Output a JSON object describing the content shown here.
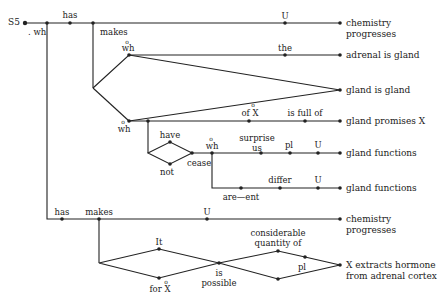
{
  "diagram": {
    "title": "S5",
    "colors": {
      "line": "#222222",
      "background": "#ffffff"
    },
    "edge_labels": {
      "wh_top": ". wh",
      "has_top": "has",
      "makes_top": "makes",
      "U_top": "U",
      "wh_upper": "wh",
      "the": "the",
      "wh_mid": "wh",
      "of_X": "of X",
      "is_full_of": "is full of",
      "have": "have",
      "not": "not",
      "cease": "cease",
      "wh_inner": "wh",
      "surprise_us": "surprise\nus",
      "pl_mid": "pl",
      "U_mid": "U",
      "are_ent": "are—ent",
      "differ": "differ",
      "U_low": "U",
      "has_bottom": "has",
      "makes_bottom": "makes",
      "U_bottom": "U",
      "It": "It",
      "for_X": "for X",
      "is_possible": "is\npossible",
      "considerable_quantity_of": "considerable\nquantity of",
      "pl_bottom": "pl",
      "degree_mark": "o"
    },
    "terminals": [
      {
        "id": "t1",
        "text": "chemistry\nprogresses"
      },
      {
        "id": "t2",
        "text": "adrenal is gland"
      },
      {
        "id": "t3",
        "text": "gland is gland"
      },
      {
        "id": "t4",
        "text": "gland promises X"
      },
      {
        "id": "t5",
        "text": "gland functions"
      },
      {
        "id": "t6",
        "text": "gland functions"
      },
      {
        "id": "t7",
        "text": "chemistry\nprogresses"
      },
      {
        "id": "t8",
        "text": "X extracts hormone\nfrom adrenal cortex"
      }
    ]
  }
}
